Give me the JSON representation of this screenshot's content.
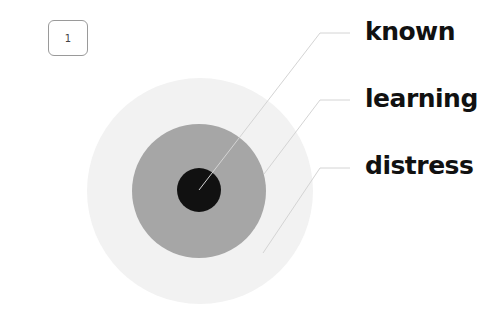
{
  "page_badge": {
    "text": "1"
  },
  "zones": [
    {
      "id": "known",
      "label": "known",
      "color": "#111111"
    },
    {
      "id": "learning",
      "label": "learning",
      "color": "#a6a6a6"
    },
    {
      "id": "distress",
      "label": "distress",
      "color": "#f2f2f2"
    }
  ],
  "callout_color": "#d4d4d4"
}
